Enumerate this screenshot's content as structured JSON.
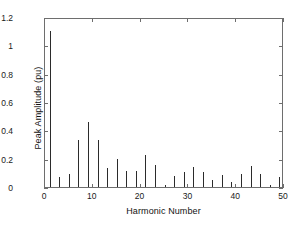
{
  "chart_data": {
    "type": "bar",
    "title": "",
    "xlabel": "Harmonic Number",
    "ylabel": "Peak Amplitude (pu)",
    "xlim": [
      0,
      50
    ],
    "ylim": [
      0,
      1.2
    ],
    "xticks": [
      0,
      10,
      20,
      30,
      40,
      50
    ],
    "xtick_labels": [
      "0",
      "10",
      "20",
      "30",
      "40",
      "50"
    ],
    "yticks": [
      0,
      0.2,
      0.4,
      0.6,
      0.8,
      1,
      1.2
    ],
    "ytick_labels": [
      "0",
      "0.2",
      "0.4",
      "0.6",
      "0.8",
      "1",
      "1.2"
    ],
    "grid": false,
    "legend": null,
    "bar_color": "#2b2b2b",
    "axis_color": "#6e6e6e",
    "categories": [
      1,
      2,
      3,
      4,
      5,
      6,
      7,
      8,
      9,
      10,
      11,
      12,
      13,
      14,
      15,
      16,
      17,
      18,
      19,
      20,
      21,
      22,
      23,
      24,
      25,
      26,
      27,
      28,
      29,
      30,
      31,
      32,
      33,
      34,
      35,
      36,
      37,
      38,
      39,
      40,
      41,
      42,
      43,
      44,
      45,
      46,
      47,
      48,
      49
    ],
    "values": [
      1.1,
      0.0,
      0.07,
      0.0,
      0.09,
      0.0,
      0.33,
      0.0,
      0.46,
      0.0,
      0.33,
      0.0,
      0.135,
      0.0,
      0.2,
      0.0,
      0.11,
      0.0,
      0.11,
      0.0,
      0.225,
      0.0,
      0.155,
      0.0,
      0.012,
      0.0,
      0.08,
      0.0,
      0.105,
      0.0,
      0.14,
      0.0,
      0.105,
      0.0,
      0.05,
      0.0,
      0.085,
      0.0,
      0.035,
      0.0,
      0.09,
      0.0,
      0.15,
      0.0,
      0.095,
      0.0,
      0.015,
      0.0,
      0.07
    ]
  },
  "axes": {
    "x_label": "Harmonic Number",
    "y_label": "Peak Amplitude (pu)"
  }
}
